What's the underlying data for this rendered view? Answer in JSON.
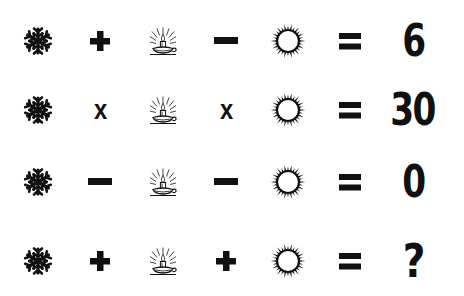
{
  "puzzle": {
    "symbols": {
      "a": "snowflake-icon",
      "b": "candle-icon",
      "c": "sun-icon"
    },
    "colors": {
      "ink": "#111111",
      "background": "#ffffff"
    },
    "rows": [
      {
        "op1": "plus",
        "op2": "minus",
        "op2_text": "",
        "op1_text": "",
        "equals": "=",
        "result": "6"
      },
      {
        "op1": "multiply",
        "op2": "multiply",
        "op1_text": "x",
        "op2_text": "x",
        "equals": "=",
        "result": "30"
      },
      {
        "op1": "minus",
        "op2": "minus",
        "op1_text": "",
        "op2_text": "",
        "equals": "=",
        "result": "0"
      },
      {
        "op1": "plus",
        "op2": "plus",
        "op1_text": "",
        "op2_text": "",
        "equals": "=",
        "result": "?"
      }
    ]
  }
}
